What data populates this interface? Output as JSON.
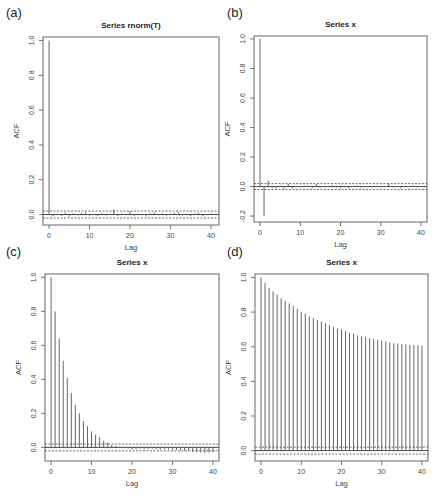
{
  "figure": {
    "panels": [
      "(a)",
      "(b)",
      "(c)",
      "(d)"
    ]
  },
  "chart_data": [
    {
      "panel": "(a)",
      "type": "bar",
      "title": "Series rnorm(T)",
      "xlabel": "Lag",
      "ylabel": "ACF",
      "xlim": [
        -1.5,
        42
      ],
      "ylim": [
        -0.06,
        1.02
      ],
      "xticks": [
        0,
        10,
        20,
        30,
        40
      ],
      "yticks": [
        0.0,
        0.2,
        0.4,
        0.6,
        0.8,
        1.0
      ],
      "ytick_labels": [
        "0.0",
        "0.2",
        "0.4",
        "0.6",
        "0.8",
        "1.0"
      ],
      "confidence_band": 0.02,
      "lags": [
        0,
        1,
        2,
        3,
        4,
        5,
        6,
        7,
        8,
        9,
        10,
        11,
        12,
        13,
        14,
        15,
        16,
        17,
        18,
        19,
        20,
        21,
        22,
        23,
        24,
        25,
        26,
        27,
        28,
        29,
        30,
        31,
        32,
        33,
        34,
        35,
        36,
        37,
        38,
        39,
        40
      ],
      "values": [
        1.0,
        -0.01,
        0.005,
        -0.008,
        0.01,
        -0.012,
        0.006,
        -0.004,
        0.009,
        0.012,
        -0.006,
        0.003,
        -0.01,
        0.008,
        -0.005,
        0.004,
        0.03,
        -0.009,
        0.006,
        -0.003,
        0.02,
        -0.007,
        0.005,
        0.004,
        -0.011,
        0.008,
        0.012,
        -0.004,
        0.007,
        -0.006,
        0.005,
        0.009,
        0.014,
        -0.005,
        0.003,
        -0.008,
        0.006,
        0.01,
        -0.01,
        0.004,
        0.007
      ],
      "grid": false
    },
    {
      "panel": "(b)",
      "type": "bar",
      "title": "Series x",
      "xlabel": "Lag",
      "ylabel": "ACF",
      "xlim": [
        -1.5,
        41.5
      ],
      "ylim": [
        -0.24,
        1.02
      ],
      "xticks": [
        0,
        10,
        20,
        30,
        40
      ],
      "yticks": [
        -0.2,
        0.0,
        0.2,
        0.4,
        0.6,
        0.8,
        1.0
      ],
      "ytick_labels": [
        "-0.2",
        "0.0",
        "0.2",
        "0.4",
        "0.6",
        "0.8",
        "1.0"
      ],
      "confidence_band": 0.02,
      "lags": [
        0,
        1,
        2,
        3,
        4,
        5,
        6,
        7,
        8,
        9,
        10,
        11,
        12,
        13,
        14,
        15,
        16,
        17,
        18,
        19,
        20,
        21,
        22,
        23,
        24,
        25,
        26,
        27,
        28,
        29,
        30,
        31,
        32,
        33,
        34,
        35,
        36,
        37,
        38,
        39,
        40
      ],
      "values": [
        1.0,
        -0.2,
        0.04,
        -0.01,
        -0.012,
        0.008,
        -0.015,
        0.018,
        -0.01,
        0.006,
        -0.005,
        0.004,
        0.006,
        -0.008,
        0.018,
        -0.006,
        0.005,
        -0.004,
        0.008,
        -0.006,
        -0.012,
        0.006,
        -0.01,
        0.004,
        0.005,
        -0.006,
        0.004,
        0.003,
        -0.005,
        0.006,
        -0.004,
        0.005,
        0.02,
        -0.006,
        0.004,
        -0.012,
        0.005,
        -0.004,
        0.006,
        -0.005,
        0.004
      ],
      "grid": false
    },
    {
      "panel": "(c)",
      "type": "bar",
      "title": "Series x",
      "xlabel": "Lag",
      "ylabel": "ACF",
      "xlim": [
        -1.5,
        41.5
      ],
      "ylim": [
        -0.08,
        1.02
      ],
      "xticks": [
        0,
        10,
        20,
        30,
        40
      ],
      "yticks": [
        0.0,
        0.2,
        0.4,
        0.6,
        0.8,
        1.0
      ],
      "ytick_labels": [
        "0.0",
        "0.2",
        "0.4",
        "0.6",
        "0.8",
        "1.0"
      ],
      "confidence_band": 0.02,
      "lags": [
        0,
        1,
        2,
        3,
        4,
        5,
        6,
        7,
        8,
        9,
        10,
        11,
        12,
        13,
        14,
        15,
        16,
        17,
        18,
        19,
        20,
        21,
        22,
        23,
        24,
        25,
        26,
        27,
        28,
        29,
        30,
        31,
        32,
        33,
        34,
        35,
        36,
        37,
        38,
        39,
        40
      ],
      "values": [
        1.0,
        0.8,
        0.64,
        0.51,
        0.41,
        0.32,
        0.25,
        0.2,
        0.155,
        0.125,
        0.095,
        0.075,
        0.06,
        0.04,
        0.03,
        0.015,
        0.008,
        0.003,
        -0.002,
        -0.005,
        -0.012,
        -0.01,
        -0.008,
        -0.01,
        -0.009,
        -0.008,
        -0.01,
        -0.012,
        -0.01,
        -0.012,
        -0.013,
        -0.015,
        -0.018,
        -0.02,
        -0.022,
        -0.025,
        -0.028,
        -0.03,
        -0.033,
        -0.03,
        -0.028
      ],
      "grid": false
    },
    {
      "panel": "(d)",
      "type": "bar",
      "title": "Series x",
      "xlabel": "Lag",
      "ylabel": "ACF",
      "xlim": [
        -1.5,
        41.5
      ],
      "ylim": [
        -0.06,
        1.02
      ],
      "xticks": [
        0,
        10,
        20,
        30,
        40
      ],
      "yticks": [
        0.0,
        0.2,
        0.4,
        0.6,
        0.8,
        1.0
      ],
      "ytick_labels": [
        "0.0",
        "0.2",
        "0.4",
        "0.6",
        "0.8",
        "1.0"
      ],
      "confidence_band": 0.02,
      "lags": [
        0,
        1,
        2,
        3,
        4,
        5,
        6,
        7,
        8,
        9,
        10,
        11,
        12,
        13,
        14,
        15,
        16,
        17,
        18,
        19,
        20,
        21,
        22,
        23,
        24,
        25,
        26,
        27,
        28,
        29,
        30,
        31,
        32,
        33,
        34,
        35,
        36,
        37,
        38,
        39,
        40
      ],
      "values": [
        1.0,
        0.97,
        0.94,
        0.92,
        0.9,
        0.88,
        0.865,
        0.85,
        0.835,
        0.82,
        0.8,
        0.79,
        0.775,
        0.765,
        0.755,
        0.745,
        0.735,
        0.725,
        0.715,
        0.705,
        0.7,
        0.69,
        0.68,
        0.675,
        0.665,
        0.66,
        0.655,
        0.65,
        0.645,
        0.64,
        0.635,
        0.63,
        0.625,
        0.62,
        0.618,
        0.615,
        0.613,
        0.612,
        0.61,
        0.608,
        0.605
      ],
      "grid": false
    }
  ],
  "layout": {
    "panel_boxes": [
      {
        "left": 43,
        "top": 37,
        "right": 219,
        "bottom": 225,
        "title_y": 28,
        "label_x": 6,
        "label_y": 17
      },
      {
        "left": 254,
        "top": 36,
        "right": 427,
        "bottom": 222,
        "title_y": 27,
        "label_x": 227,
        "label_y": 17
      },
      {
        "left": 45,
        "top": 274,
        "right": 219,
        "bottom": 461,
        "title_y": 265,
        "label_x": 6,
        "label_y": 256
      },
      {
        "left": 255,
        "top": 274,
        "right": 428,
        "bottom": 461,
        "title_y": 265,
        "label_x": 227,
        "label_y": 256
      }
    ]
  }
}
